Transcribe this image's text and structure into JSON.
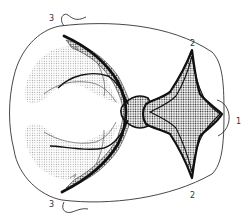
{
  "diagram": {
    "type": "anatomical-line-drawing",
    "colors": {
      "outline": "#333333",
      "heavy_line": "#111111",
      "stipple_dark": "#222222",
      "stipple_light": "#9a9a9a",
      "background": "#ffffff"
    },
    "labels": [
      {
        "id": "label-1",
        "text": "1",
        "x": 236,
        "y": 124
      },
      {
        "id": "label-2-top",
        "text": "2",
        "x": 190,
        "y": 46
      },
      {
        "id": "label-2-bottom",
        "text": "2",
        "x": 190,
        "y": 198
      },
      {
        "id": "label-3-top",
        "text": "3",
        "x": 49,
        "y": 21
      },
      {
        "id": "label-3-bottom",
        "text": "3",
        "x": 49,
        "y": 207
      }
    ],
    "regions": [
      {
        "id": "star-region",
        "description": "four-pointed star shaped densely stippled region with thick outline, points toward labels 1 and 2"
      },
      {
        "id": "central-junction",
        "description": "small stippled connecting region between left arcs and star"
      },
      {
        "id": "left-upper-fan",
        "description": "lightly stippled fan region, upper left"
      },
      {
        "id": "left-lower-fan",
        "description": "lightly stippled fan region, lower left"
      }
    ],
    "lines": [
      {
        "id": "heavy-arc",
        "description": "thick curved line from upper-left tip near label 3 to lower-left tip near label 3"
      },
      {
        "id": "inner-arc-upper",
        "description": "thinner branching arc in upper left"
      },
      {
        "id": "inner-arc-lower",
        "description": "thinner branching arc in lower left"
      },
      {
        "id": "outer-outline",
        "description": "rounded outline of the overall shape"
      },
      {
        "id": "right-bracket",
        "description": "curved bracket at right edge next to label 1"
      },
      {
        "id": "tab-top",
        "description": "wavy tab at top left next to label 3"
      },
      {
        "id": "tab-bottom",
        "description": "wavy tab at bottom left next to label 3"
      }
    ]
  }
}
